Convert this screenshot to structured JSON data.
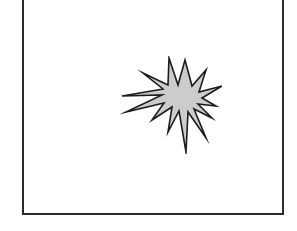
{
  "figure": {
    "background_color": "#ffffff",
    "border_color": "#2b2b2b",
    "border_width_px": 2,
    "frame": {
      "left_px": 22,
      "top_px": -8,
      "width_px": 262,
      "height_px": 223,
      "note": "top edge clipped above viewport"
    },
    "caption": "",
    "title": ""
  },
  "shape": {
    "name": "starburst",
    "alt_names": [
      "explosion",
      "spiky-star",
      "burst"
    ],
    "fill_color": "#cccccc",
    "stroke_color": "#1c1c1c",
    "stroke_width_px": 1.6,
    "point_count": 10,
    "center": {
      "x": 150,
      "y": 110
    },
    "bounds": {
      "left": 100,
      "top": 64,
      "right": 196,
      "bottom": 158
    },
    "style": "irregular hand-drawn spikes of varying length",
    "polygon_points": "65,4 72,30 86,14 79,36 102,30 82,42 96,50 78,48 92,62 74,53 86,82 68,56 66,96 59,55 48,76 52,51 32,64 44,47 6,56 42,39 2,40 43,33 23,17 48,29 49,2 58,29"
  }
}
